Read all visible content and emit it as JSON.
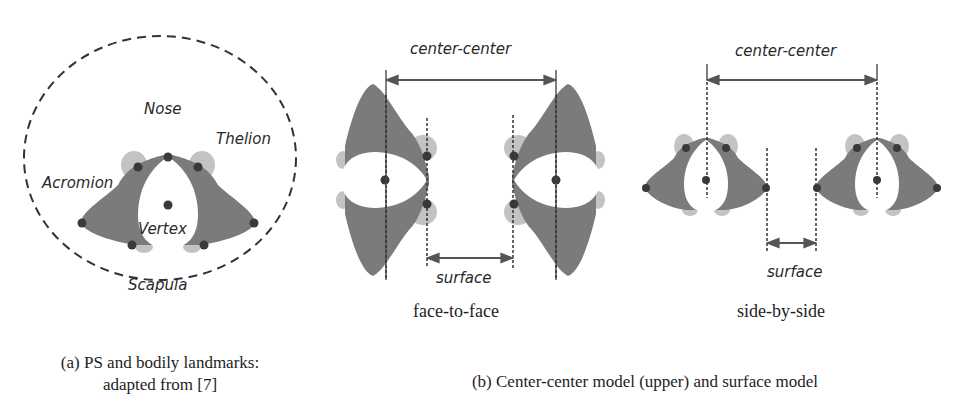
{
  "colors": {
    "body": "#7b7b7b",
    "arm": "#c3c3c3",
    "head": "#ffffff",
    "dot": "#3a3a3a",
    "line": "#555555",
    "text": "#2a2a2a"
  },
  "panel_a": {
    "landmarks": {
      "nose": "Nose",
      "thelion": "Thelion",
      "acromion": "Acromion",
      "vertex": "Vertex",
      "scapula": "Scapula"
    },
    "caption_line1": "(a) PS and bodily landmarks:",
    "caption_line2": "adapted from [7]"
  },
  "panel_b": {
    "face_to_face": {
      "center_label": "center-center",
      "surface_label": "surface",
      "title": "face-to-face"
    },
    "side_by_side": {
      "center_label": "center-center",
      "surface_label": "surface",
      "title": "side-by-side"
    },
    "caption": "(b) Center-center model (upper) and surface model"
  }
}
